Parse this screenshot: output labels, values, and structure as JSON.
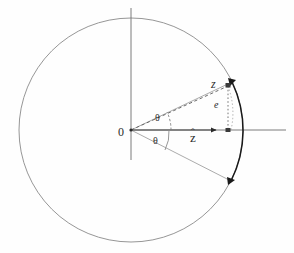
{
  "figure": {
    "kind": "geometric-diagram",
    "width": 294,
    "height": 253,
    "background_color": "#fefefe"
  },
  "colors": {
    "circle_stroke": "#8a8a8a",
    "axis_stroke": "#6e6e6e",
    "ray_stroke": "#9a9a9a",
    "dashed_stroke": "#5a5a5a",
    "dotted_stroke": "#6a6a6a",
    "arc_highlight": "#1a1a1a",
    "arrow_fill": "#2b2b2b",
    "text_color": "#2b2b2b"
  },
  "geometry": {
    "center": {
      "x": 131,
      "y": 130
    },
    "circle_radius": 112,
    "vertical_axis": {
      "x": 131,
      "y_top": 8,
      "y_bottom": 160
    },
    "horizontal_axis": {
      "y": 130,
      "x_left": 131,
      "x_right": 286
    },
    "zhat_arrow_tip": {
      "x": 219,
      "y": 130
    },
    "z_point": {
      "x": 227,
      "y": 85
    },
    "z_foot": {
      "x": 227,
      "y": 130
    },
    "upper_ray_end": {
      "x": 218,
      "y": 62
    },
    "lower_ray_end": {
      "x": 203,
      "y": 200
    },
    "theta_upper_deg": 25,
    "theta_lower_deg": 27
  },
  "labels": {
    "origin": "0",
    "theta_upper": "θ",
    "theta_lower": "θ",
    "z_hat": "z",
    "z_hat_accent": "ˆ",
    "z_point": "z",
    "e": "e"
  },
  "elements": {
    "circle_name": "unit-circle",
    "vertical_axis_name": "vertical-axis",
    "horizontal_axis_name": "horizontal-axis",
    "highlight_arc_name": "highlighted-arc",
    "dashed_vector_name": "dashed-z-vector",
    "dotted_drop_name": "dotted-drop-line",
    "zhat_vector_name": "zhat-arrow"
  }
}
